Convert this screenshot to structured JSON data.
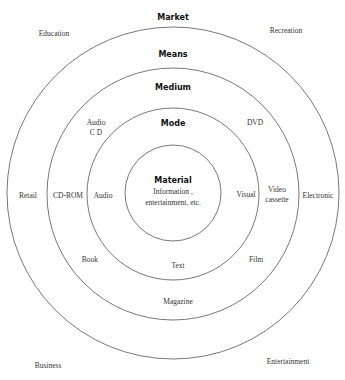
{
  "diagram": {
    "type": "concentric-circles",
    "center": {
      "x": 173,
      "y": 193
    },
    "stroke_color": "#555555",
    "rings": [
      {
        "name": "Market",
        "radius": 166
      },
      {
        "name": "Means",
        "radius": 126
      },
      {
        "name": "Medium",
        "radius": 86
      },
      {
        "name": "Mode",
        "radius": 48
      }
    ],
    "headings": {
      "market": "Market",
      "means": "Means",
      "medium": "Medium",
      "mode": "Mode",
      "material": "Material"
    },
    "material_text": {
      "line1": "Information ,",
      "line2": "entertainment, etc."
    },
    "market_labels": {
      "top_left": "Education",
      "top_right": "Recreation",
      "bottom_left": "Business",
      "bottom_right": "Entertainment"
    },
    "means_labels": {
      "left": "Retail",
      "right": "Electronic"
    },
    "medium_labels": {
      "top_left_line1": "Audio",
      "top_left_line2": "C D",
      "top_right": "DVD",
      "left": "CD-ROM",
      "right_line1": "Video",
      "right_line2": "cassette",
      "bottom_left": "Book",
      "bottom_right": "Film",
      "bottom": "Magazine"
    },
    "mode_labels": {
      "left": "Audio",
      "right": "Visual",
      "bottom": "Text"
    }
  }
}
